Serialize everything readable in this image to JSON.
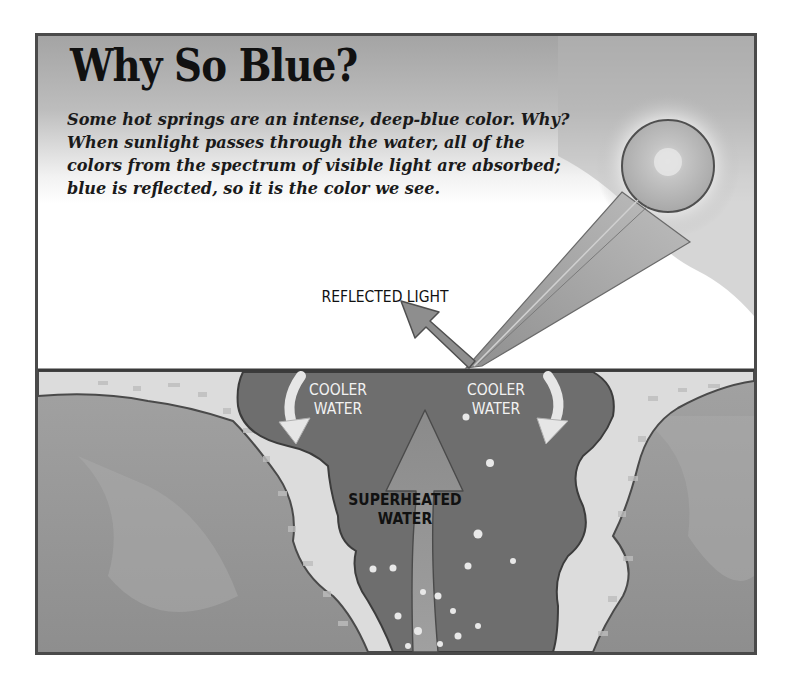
{
  "figure": {
    "title": "Why So Blue?",
    "description_lines": [
      "Some hot springs are an intense, deep-blue color. Why?",
      "When sunlight passes through the water, all of the",
      "colors from the spectrum of visible light are absorbed;",
      "blue is reflected, so it is the color we see."
    ],
    "labels": {
      "reflected_light": "REFLECTED LIGHT",
      "cooler_water_left": [
        "COOLER",
        "WATER"
      ],
      "cooler_water_right": [
        "COOLER",
        "WATER"
      ],
      "superheated_water": [
        "SUPERHEATED",
        "WATER"
      ]
    },
    "elements": {
      "sun": "sun-icon",
      "incoming_beam": "sunlight-beam",
      "reflected_arrow": "reflected-light-arrow",
      "convection_arrows": "curved-arrow-icon",
      "upward_arrow": "upward-arrow-icon"
    },
    "colors": {
      "frame": "#4a4a4a",
      "sky_top": "#a9a9a9",
      "sky_bottom": "#ffffff",
      "ground": "#9a9a9a",
      "sinter": "#dcdcdc",
      "pool_water": "#6e6e6e",
      "arrow_fill": "#8c8c8c",
      "text_dark": "#111111",
      "text_light": "#f2f2f2"
    }
  }
}
